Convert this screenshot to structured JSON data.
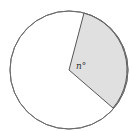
{
  "diagram": {
    "type": "circle-sector",
    "circle": {
      "cx": 69,
      "cy": 70,
      "r": 59,
      "stroke": "#6b6b6b",
      "fill": "#ffffff"
    },
    "sector": {
      "start_point": [
        84,
        13
      ],
      "end_point": [
        113,
        108
      ],
      "fill": "#e0e0e0",
      "stroke": "#555555",
      "angle_label": "n°"
    }
  }
}
